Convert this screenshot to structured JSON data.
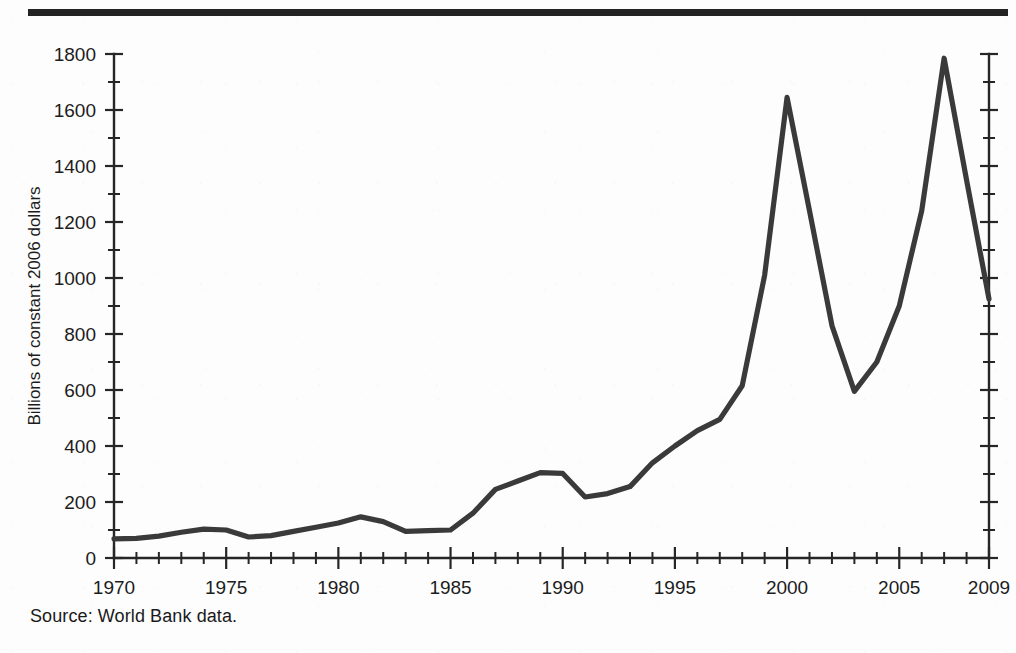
{
  "figure": {
    "source_note": "Source: World Bank data.",
    "has_top_rule": true,
    "line_color": "#3a3a3a",
    "axis_color": "#262626",
    "background_color": "#fdfdfd"
  },
  "chart_data": {
    "type": "line",
    "title": "",
    "subtitle": "",
    "xlabel": "",
    "ylabel": "Billions of constant 2006 dollars",
    "xlim": [
      1970,
      2009
    ],
    "ylim": [
      0,
      1800
    ],
    "y_tick_step": 200,
    "y_minor_tick_step": 100,
    "x_tick_step": 1,
    "x_label_step": 5,
    "grid": false,
    "legend": false,
    "legend_position": "none",
    "y_ticks": [
      0,
      200,
      400,
      600,
      800,
      1000,
      1200,
      1400,
      1600,
      1800
    ],
    "y_tick_labels": [
      "0",
      "200",
      "400",
      "600",
      "800",
      "1000",
      "1200",
      "1400",
      "1600",
      "1800"
    ],
    "x_ticks": [
      1970,
      1975,
      1980,
      1985,
      1990,
      1995,
      2000,
      2005,
      2009
    ],
    "x_tick_labels": [
      "1970",
      "1975",
      "1980",
      "1985",
      "1990",
      "1995",
      "2000",
      "2005",
      "2009"
    ],
    "x": [
      1970,
      1971,
      1972,
      1973,
      1974,
      1975,
      1976,
      1977,
      1978,
      1979,
      1980,
      1981,
      1982,
      1983,
      1984,
      1985,
      1986,
      1987,
      1988,
      1989,
      1990,
      1991,
      1992,
      1993,
      1994,
      1995,
      1996,
      1997,
      1998,
      1999,
      2000,
      2001,
      2002,
      2003,
      2004,
      2005,
      2006,
      2007,
      2008,
      2009
    ],
    "values": [
      68,
      70,
      78,
      92,
      103,
      100,
      75,
      80,
      95,
      110,
      125,
      147,
      130,
      95,
      98,
      100,
      160,
      245,
      275,
      305,
      302,
      218,
      230,
      255,
      340,
      400,
      455,
      495,
      615,
      1010,
      1645,
      1240,
      830,
      595,
      700,
      900,
      1240,
      1785,
      1350,
      925
    ],
    "series": [
      {
        "name": "Value",
        "values": [
          68,
          70,
          78,
          92,
          103,
          100,
          75,
          80,
          95,
          110,
          125,
          147,
          130,
          95,
          98,
          100,
          160,
          245,
          275,
          305,
          302,
          218,
          230,
          255,
          340,
          400,
          455,
          495,
          615,
          1010,
          1645,
          1240,
          830,
          595,
          700,
          900,
          1240,
          1785,
          1350,
          925
        ]
      }
    ]
  }
}
